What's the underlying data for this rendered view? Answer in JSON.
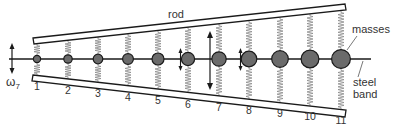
{
  "diagram": {
    "labels": {
      "rod": "rod",
      "masses": "masses",
      "steel": "steel",
      "band": "band",
      "omega": "ω",
      "omega_sub": "7"
    },
    "masses": [
      {
        "n": "1",
        "x": 37,
        "r": 3.6,
        "y_label": 90
      },
      {
        "n": "2",
        "x": 68,
        "r": 4.2,
        "y_label": 94
      },
      {
        "n": "3",
        "x": 98,
        "r": 4.8,
        "y_label": 97
      },
      {
        "n": "4",
        "x": 128,
        "r": 5.4,
        "y_label": 101
      },
      {
        "n": "5",
        "x": 158,
        "r": 6.0,
        "y_label": 104
      },
      {
        "n": "6",
        "x": 188,
        "r": 6.6,
        "y_label": 108
      },
      {
        "n": "7",
        "x": 219,
        "r": 7.2,
        "y_label": 111
      },
      {
        "n": "8",
        "x": 249,
        "r": 7.8,
        "y_label": 114
      },
      {
        "n": "9",
        "x": 280,
        "r": 8.3,
        "y_label": 117
      },
      {
        "n": "10",
        "x": 310,
        "r": 8.9,
        "y_label": 120
      },
      {
        "n": "11",
        "x": 341,
        "r": 9.4,
        "y_label": 124
      }
    ],
    "colors": {
      "mass_fill": "#6b6b6b",
      "stroke": "#1a1a1a",
      "spring": "#8a8a8a"
    }
  }
}
